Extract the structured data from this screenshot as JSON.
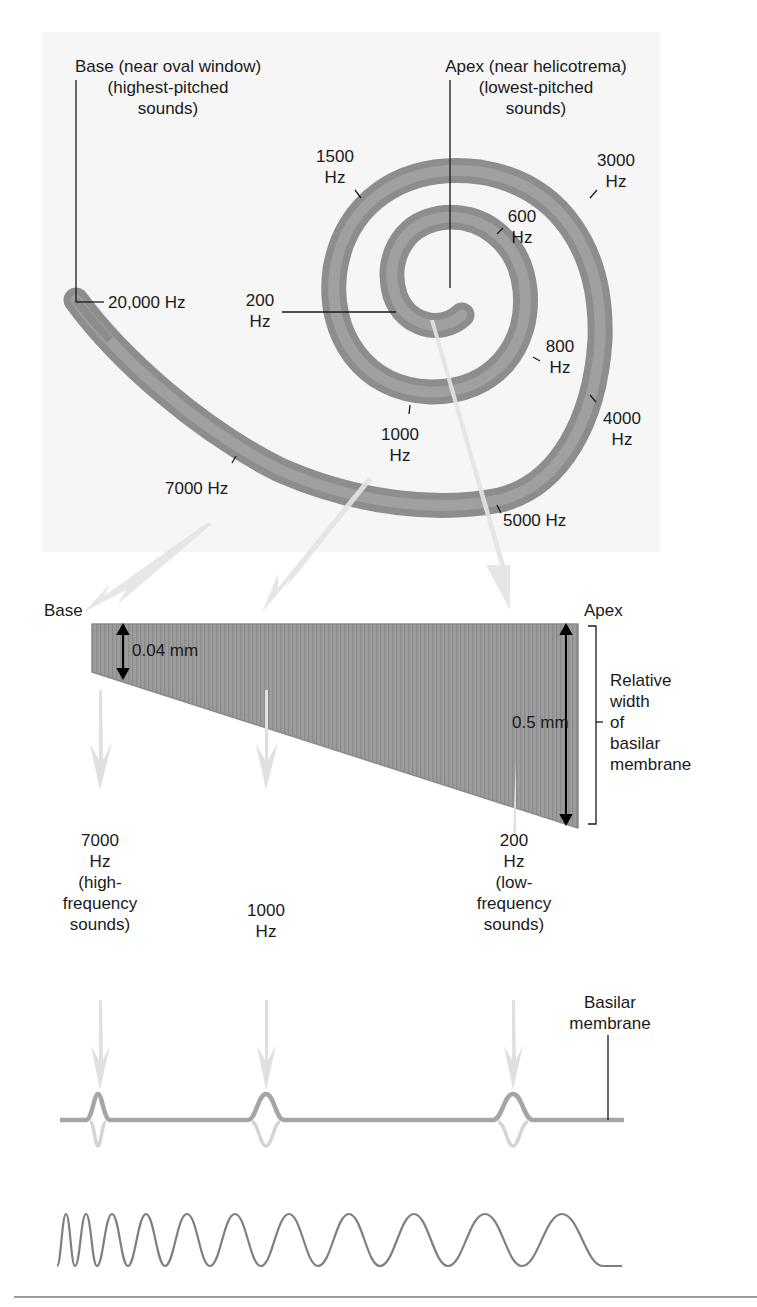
{
  "figure": {
    "colors": {
      "membrane": "#9a9a9a",
      "membrane_dark": "#7f7f7f",
      "arrow": "#e2e2e2",
      "panel_bg": "#f6f6f6",
      "text": "#1a1a1a"
    }
  },
  "cochlea": {
    "base_label": {
      "line1": "Base (near oval window)",
      "line2": "(highest-pitched",
      "line3": "sounds)"
    },
    "apex_label": {
      "line1": "Apex (near helicotrema)",
      "line2": "(lowest-pitched",
      "line3": "sounds)"
    },
    "frequency_labels": [
      {
        "id": "f20000",
        "line1": "20,000 Hz",
        "line2": ""
      },
      {
        "id": "f1500",
        "line1": "1500",
        "line2": "Hz"
      },
      {
        "id": "f3000",
        "line1": "3000",
        "line2": "Hz"
      },
      {
        "id": "f600",
        "line1": "600",
        "line2": "Hz"
      },
      {
        "id": "f200",
        "line1": "200",
        "line2": "Hz"
      },
      {
        "id": "f800",
        "line1": "800",
        "line2": "Hz"
      },
      {
        "id": "f4000",
        "line1": "4000",
        "line2": "Hz"
      },
      {
        "id": "f1000",
        "line1": "1000",
        "line2": "Hz"
      },
      {
        "id": "f7000",
        "line1": "7000 Hz",
        "line2": ""
      },
      {
        "id": "f5000",
        "line1": "5000 Hz",
        "line2": ""
      }
    ]
  },
  "membrane": {
    "base_label": "Base",
    "apex_label": "Apex",
    "base_width": "0.04 mm",
    "apex_width": "0.5 mm",
    "bracket_label": {
      "line1": "Relative",
      "line2": "width",
      "line3": "of",
      "line4": "basilar",
      "line5": "membrane"
    }
  },
  "responses": [
    {
      "line1": "7000",
      "line2": "Hz",
      "line3": "(high-",
      "line4": "frequency",
      "line5": "sounds)"
    },
    {
      "line1": "1000",
      "line2": "Hz",
      "line3": "",
      "line4": "",
      "line5": ""
    },
    {
      "line1": "200",
      "line2": "Hz",
      "line3": "(low-",
      "line4": "frequency",
      "line5": "sounds)"
    }
  ],
  "waveform": {
    "label": {
      "line1": "Basilar",
      "line2": "membrane"
    },
    "peaks_x": [
      98,
      266,
      513
    ]
  }
}
